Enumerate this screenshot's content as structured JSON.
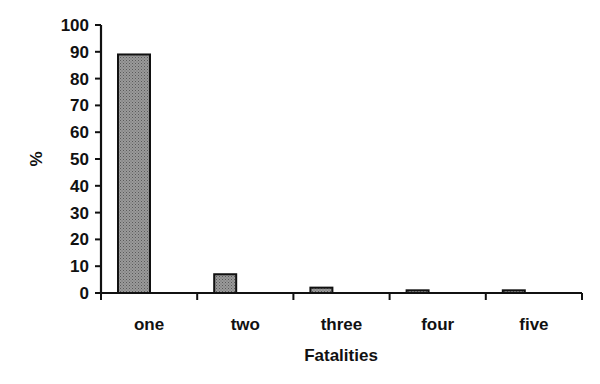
{
  "chart_data": {
    "type": "bar",
    "title": "",
    "xlabel": "Fatalities",
    "ylabel": "%",
    "categories": [
      "one",
      "two",
      "three",
      "four",
      "five"
    ],
    "values": [
      89,
      7,
      2,
      1,
      1
    ],
    "ylim": [
      0,
      100
    ],
    "yticks": [
      0,
      10,
      20,
      30,
      40,
      50,
      60,
      70,
      80,
      90,
      100
    ],
    "grid": false,
    "legend": null,
    "bar_color": "#8a8a8a",
    "bar_edge_color": "#111111"
  }
}
